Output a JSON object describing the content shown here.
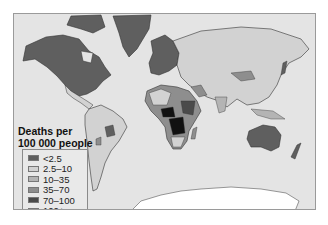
{
  "map": {
    "title_line1": "Deaths per",
    "title_line2": "100 000 people",
    "colors": {
      "ocean": "#e4e4e4",
      "antarctica": "#ffffff",
      "border": "#333333"
    },
    "legend": [
      {
        "label": "<2.5",
        "color": "#5f5f5f"
      },
      {
        "label": "2.5–10",
        "color": "#d2d2d2"
      },
      {
        "label": "10–35",
        "color": "#b4b4b4"
      },
      {
        "label": "35–70",
        "color": "#8e8e8e"
      },
      {
        "label": "70–100",
        "color": "#4a4a4a"
      },
      {
        "label": "100+",
        "color": "#111111"
      }
    ]
  }
}
